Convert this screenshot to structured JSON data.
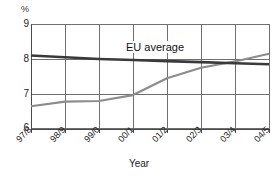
{
  "chart_data": {
    "type": "line",
    "title": "",
    "xlabel": "Year",
    "ylabel": "%",
    "ylim": [
      6,
      9
    ],
    "yticks": [
      6,
      7,
      8,
      9
    ],
    "grid": true,
    "legend_position": "inline-annotation",
    "categories": [
      "97/8",
      "98/9",
      "99/0",
      "00/1",
      "01/2",
      "02/3",
      "03/4",
      "04/5"
    ],
    "series": [
      {
        "name": "EU average",
        "color": "#3a3a3a",
        "values": [
          8.1,
          8.05,
          8.0,
          7.97,
          7.94,
          7.91,
          7.88,
          7.85
        ]
      },
      {
        "name": "rising series",
        "color": "#8c8c8c",
        "values": [
          6.65,
          6.78,
          6.8,
          6.97,
          7.45,
          7.75,
          7.93,
          8.15
        ]
      }
    ],
    "annotations": [
      {
        "text": "EU average",
        "x_category": "01/2",
        "y_value": 8.45
      }
    ]
  },
  "axes": {
    "unit_label": "%",
    "y_tick_labels": [
      "9",
      "8",
      "7",
      "6"
    ],
    "x_tick_labels": [
      "97/8",
      "98/9",
      "99/0",
      "00/1",
      "01/2",
      "02/3",
      "03/4",
      "04/5"
    ],
    "x_axis_title": "Year"
  },
  "colors": {
    "eu_average_line": "#3a3a3a",
    "rising_line": "#8c8c8c",
    "grid": "#6f6f6f",
    "axis": "#4a4a4a",
    "background": "#ffffff"
  }
}
